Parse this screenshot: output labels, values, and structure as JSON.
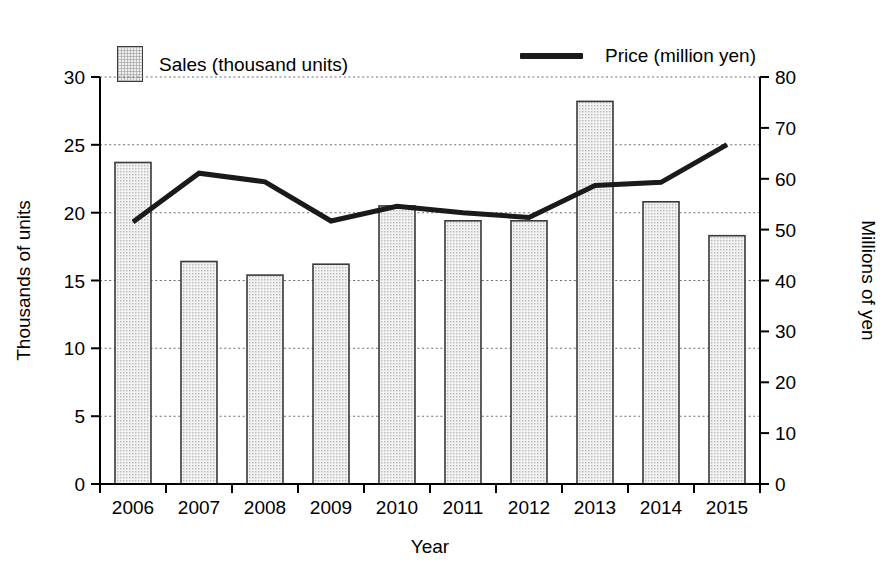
{
  "legend": {
    "sales": {
      "label": "Sales (thousand units)",
      "marker": "bar-swatch-icon"
    },
    "price": {
      "label": "Price (million yen)",
      "marker": "line-swatch-icon"
    }
  },
  "axes": {
    "x_title": "Year",
    "y_left_title": "Thousands of units",
    "y_right_title": "Millions of yen"
  },
  "chart_data": {
    "type": "bar",
    "title": "",
    "subtitle": "",
    "xlabel": "Year",
    "ylabel": "Thousands of units",
    "y2label": "Millions of yen",
    "categories": [
      "2006",
      "2007",
      "2008",
      "2009",
      "2010",
      "2011",
      "2012",
      "2013",
      "2014",
      "2015"
    ],
    "series": [
      {
        "name": "Sales (thousand units)",
        "type": "bar",
        "axis": "left",
        "values": [
          23.7,
          16.4,
          15.4,
          16.2,
          20.5,
          19.4,
          19.4,
          28.2,
          20.8,
          18.3
        ]
      },
      {
        "name": "Price (million yen)",
        "type": "line",
        "axis": "right",
        "values": [
          51.5,
          61.1,
          59.4,
          51.7,
          54.6,
          53.3,
          52.4,
          58.7,
          59.3,
          66.7
        ]
      }
    ],
    "ylim": [
      0,
      30
    ],
    "yticks": [
      0,
      5,
      10,
      15,
      20,
      25,
      30
    ],
    "y2lim": [
      0,
      80
    ],
    "y2ticks": [
      0,
      10,
      20,
      30,
      40,
      50,
      60,
      70,
      80
    ],
    "grid": true,
    "grid_style": "dotted-horizontal",
    "legend_position": "top",
    "colors": {
      "bar_fill": "#efefef",
      "bar_edge": "#3a3a3a",
      "line": "#1a1a1a",
      "grid": "#6e6e6e",
      "axis": "#000000",
      "background": "#ffffff"
    }
  }
}
